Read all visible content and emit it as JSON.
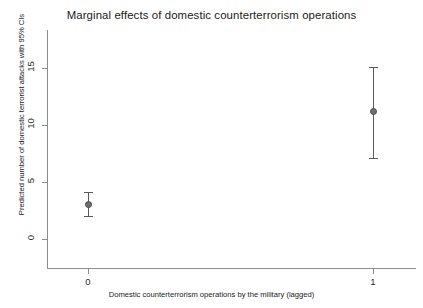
{
  "chart_data": {
    "type": "scatter",
    "title": "Marginal effects of domestic counterterrorism operations",
    "xlabel": "Domestic counterterrorism operations by the military (lagged)",
    "ylabel": "Predicted number of domestic terrorist attacks with 95% CIs",
    "categories": [
      "0",
      "1"
    ],
    "xtick_labels": [
      "0",
      "1"
    ],
    "ytick_labels": [
      "0",
      "5",
      "10",
      "15"
    ],
    "yticks": [
      0,
      5,
      10,
      15
    ],
    "ylim": [
      -2.5,
      18.5
    ],
    "xlim": [
      -0.15,
      1.15
    ],
    "grid": false,
    "legend": "none",
    "marker_color": "#6e6e6e",
    "line_color": "#5a5a5a",
    "axis_color": "#8c8c8c",
    "series": [
      {
        "name": "Predicted number of domestic terrorist attacks",
        "points": [
          {
            "x": 0,
            "label": "0",
            "value": 3.0,
            "ci_low": 2.0,
            "ci_high": 4.1
          },
          {
            "x": 1,
            "label": "1",
            "value": 11.2,
            "ci_low": 7.1,
            "ci_high": 15.1
          }
        ]
      }
    ]
  }
}
